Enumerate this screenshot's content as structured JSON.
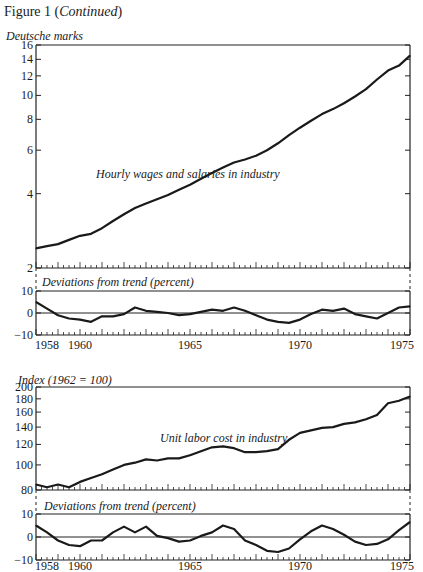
{
  "figure_title": {
    "prefix": "Figure 1 (",
    "emph": "Continued",
    "suffix": ")"
  },
  "chart_data": [
    {
      "type": "line",
      "title": "Hourly wages and salaries in industry",
      "ylabel": "Deutsche marks",
      "yscale": "log",
      "ylim": [
        2,
        16
      ],
      "yticks": [
        2,
        4,
        6,
        8,
        10,
        12,
        14,
        16
      ],
      "xlim": [
        1958,
        1975
      ],
      "series": [
        {
          "name": "Hourly wages and salaries in industry",
          "x": [
            1958,
            1958.5,
            1959,
            1959.5,
            1960,
            1960.5,
            1961,
            1961.5,
            1962,
            1962.5,
            1963,
            1963.5,
            1964,
            1964.5,
            1965,
            1965.5,
            1966,
            1966.5,
            1967,
            1967.5,
            1968,
            1968.5,
            1969,
            1969.5,
            1970,
            1970.5,
            1971,
            1971.5,
            1972,
            1972.5,
            1973,
            1973.5,
            1974,
            1974.5,
            1975
          ],
          "y": [
            2.4,
            2.45,
            2.5,
            2.6,
            2.7,
            2.75,
            2.9,
            3.1,
            3.3,
            3.5,
            3.65,
            3.8,
            3.95,
            4.15,
            4.35,
            4.6,
            4.85,
            5.1,
            5.35,
            5.5,
            5.7,
            6.0,
            6.4,
            6.9,
            7.4,
            7.9,
            8.4,
            8.8,
            9.3,
            9.9,
            10.6,
            11.6,
            12.6,
            13.2,
            14.5
          ]
        }
      ]
    },
    {
      "type": "line",
      "title": "Deviations from trend (percent)",
      "ylabel": "",
      "ylim": [
        -10,
        10
      ],
      "yticks": [
        -10,
        0,
        10
      ],
      "xlim": [
        1958,
        1975
      ],
      "xticks": [
        1958,
        1960,
        1965,
        1970,
        1975
      ],
      "series": [
        {
          "name": "Hourly wages deviations from trend",
          "x": [
            1958,
            1958.5,
            1959,
            1959.5,
            1960,
            1960.5,
            1961,
            1961.5,
            1962,
            1962.5,
            1963,
            1963.5,
            1964,
            1964.5,
            1965,
            1965.5,
            1966,
            1966.5,
            1967,
            1967.5,
            1968,
            1968.5,
            1969,
            1969.5,
            1970,
            1970.5,
            1971,
            1971.5,
            1972,
            1972.5,
            1973,
            1973.5,
            1974,
            1974.5,
            1975
          ],
          "y": [
            5,
            2,
            -1,
            -2.5,
            -3,
            -4,
            -1.5,
            -1.5,
            -0.5,
            2.5,
            1,
            0.5,
            0,
            -1,
            -0.5,
            0.5,
            1.5,
            1,
            2.5,
            1,
            -1,
            -3,
            -4,
            -4.5,
            -3,
            -0.5,
            1.5,
            1,
            2,
            -0.5,
            -1.5,
            -2.5,
            0,
            2.5,
            3
          ]
        }
      ]
    },
    {
      "type": "line",
      "title": "Unit labor cost in industry",
      "ylabel": "Index (1962 = 100)",
      "yscale": "log",
      "ylim": [
        80,
        200
      ],
      "yticks": [
        80,
        100,
        120,
        140,
        160,
        180,
        200
      ],
      "xlim": [
        1958,
        1975
      ],
      "series": [
        {
          "name": "Unit labor cost in industry",
          "x": [
            1958,
            1958.5,
            1959,
            1959.5,
            1960,
            1960.5,
            1961,
            1961.5,
            1962,
            1962.5,
            1963,
            1963.5,
            1964,
            1964.5,
            1965,
            1965.5,
            1966,
            1966.5,
            1967,
            1967.5,
            1968,
            1968.5,
            1969,
            1969.5,
            1970,
            1970.5,
            1971,
            1971.5,
            1972,
            1972.5,
            1973,
            1973.5,
            1974,
            1974.5,
            1975
          ],
          "y": [
            84,
            82,
            84,
            82,
            86,
            89,
            92,
            96,
            100,
            102,
            105,
            104,
            106,
            106,
            109,
            113,
            117,
            118,
            116,
            112,
            112,
            113,
            115,
            125,
            133,
            136,
            139,
            140,
            144,
            146,
            150,
            156,
            173,
            177,
            184
          ]
        }
      ]
    },
    {
      "type": "line",
      "title": "Deviations from trend (percent)",
      "ylabel": "",
      "ylim": [
        -10,
        10
      ],
      "yticks": [
        -10,
        0,
        10
      ],
      "xlim": [
        1958,
        1975
      ],
      "xticks": [
        1958,
        1960,
        1965,
        1970,
        1975
      ],
      "series": [
        {
          "name": "Unit labor cost deviations from trend",
          "x": [
            1958,
            1958.5,
            1959,
            1959.5,
            1960,
            1960.5,
            1961,
            1961.5,
            1962,
            1962.5,
            1963,
            1963.5,
            1964,
            1964.5,
            1965,
            1965.5,
            1966,
            1966.5,
            1967,
            1967.5,
            1968,
            1968.5,
            1969,
            1969.5,
            1970,
            1970.5,
            1971,
            1971.5,
            1972,
            1972.5,
            1973,
            1973.5,
            1974,
            1974.5,
            1975
          ],
          "y": [
            5,
            2,
            -1.5,
            -3.5,
            -4,
            -1.5,
            -1.5,
            2,
            4.5,
            2,
            4.5,
            0.5,
            -0.5,
            -2,
            -1.5,
            0.5,
            2,
            5,
            3.5,
            -1.5,
            -3.5,
            -6,
            -6.5,
            -5,
            -1,
            2.5,
            5,
            3.5,
            1,
            -2,
            -3.5,
            -3,
            -1,
            3,
            6.5
          ]
        }
      ]
    }
  ],
  "labels": {
    "panel1_ylabel": "Deutsche marks",
    "panel1_series": "Hourly wages and salaries in industry",
    "panel2_title": "Deviations from trend (percent)",
    "panel3_ylabel": "Index (1962 = 100)",
    "panel3_series": "Unit labor cost in industry",
    "panel4_title": "Deviations from trend (percent)",
    "xticks": [
      "1958",
      "1960",
      "1965",
      "1970",
      "1975"
    ],
    "p1_yticks": [
      "16",
      "14",
      "12",
      "10",
      "8",
      "6",
      "4",
      "2"
    ],
    "p2_yticks": [
      "10",
      "0",
      "−10"
    ],
    "p3_yticks": [
      "200",
      "180",
      "160",
      "140",
      "120",
      "100",
      "80"
    ],
    "p4_yticks": [
      "10",
      "0",
      "−10"
    ]
  }
}
